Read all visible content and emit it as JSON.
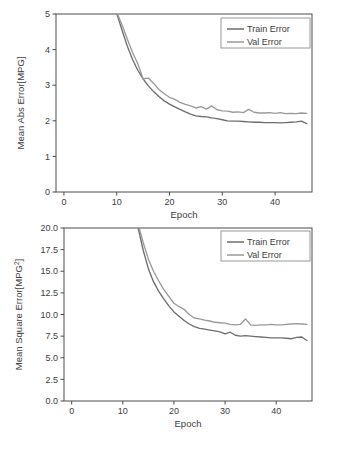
{
  "figure": {
    "background_color": "#ffffff",
    "frame_color": "#4c4c4c",
    "text_color": "#3d3d3d"
  },
  "chart_data": [
    {
      "id": "mean-abs-error",
      "type": "line",
      "title": "",
      "xlabel": "Epoch",
      "ylabel": "Mean Abs Error[MPG]",
      "xlim": [
        -1.5,
        47
      ],
      "ylim": [
        0,
        5
      ],
      "xticks": [
        0,
        10,
        20,
        30,
        40
      ],
      "yticks": [
        0,
        1,
        2,
        3,
        4,
        5
      ],
      "xticklabels": [
        "0",
        "10",
        "20",
        "30",
        "40"
      ],
      "yticklabels": [
        "0",
        "1",
        "2",
        "3",
        "4",
        "5"
      ],
      "grid": false,
      "legend_position": "upper right",
      "series": [
        {
          "name": "Train Error",
          "color": "#6e6e6e",
          "x": [
            0,
            1,
            2,
            3,
            4,
            5,
            6,
            7,
            8,
            9,
            10,
            11,
            12,
            13,
            14,
            15,
            16,
            17,
            18,
            19,
            20,
            21,
            22,
            23,
            24,
            25,
            26,
            27,
            28,
            29,
            30,
            31,
            32,
            33,
            34,
            35,
            36,
            37,
            38,
            39,
            40,
            41,
            42,
            43,
            44,
            45,
            46
          ],
          "values": [
            18.2,
            15.1,
            12.4,
            10.2,
            8.6,
            7.4,
            6.6,
            6.0,
            5.6,
            5.3,
            5.02,
            4.55,
            4.1,
            3.72,
            3.42,
            3.18,
            2.98,
            2.82,
            2.68,
            2.56,
            2.47,
            2.39,
            2.32,
            2.25,
            2.19,
            2.14,
            2.12,
            2.11,
            2.08,
            2.06,
            2.03,
            2.0,
            1.99,
            1.99,
            1.98,
            1.97,
            1.96,
            1.96,
            1.95,
            1.95,
            1.95,
            1.94,
            1.95,
            1.96,
            1.97,
            1.99,
            1.92
          ]
        },
        {
          "name": "Val Error",
          "color": "#9a9a9a",
          "x": [
            0,
            1,
            2,
            3,
            4,
            5,
            6,
            7,
            8,
            9,
            10,
            11,
            12,
            13,
            14,
            15,
            16,
            17,
            18,
            19,
            20,
            21,
            22,
            23,
            24,
            25,
            26,
            27,
            28,
            29,
            30,
            31,
            32,
            33,
            34,
            35,
            36,
            37,
            38,
            39,
            40,
            41,
            42,
            43,
            44,
            45,
            46
          ],
          "values": [
            18.0,
            14.9,
            12.3,
            10.1,
            8.6,
            7.5,
            6.7,
            6.1,
            5.7,
            5.4,
            5.05,
            4.7,
            4.3,
            3.92,
            3.6,
            3.18,
            3.2,
            3.05,
            2.88,
            2.76,
            2.66,
            2.6,
            2.52,
            2.46,
            2.42,
            2.36,
            2.4,
            2.33,
            2.42,
            2.31,
            2.28,
            2.27,
            2.24,
            2.25,
            2.23,
            2.32,
            2.24,
            2.22,
            2.22,
            2.23,
            2.21,
            2.23,
            2.2,
            2.21,
            2.2,
            2.22,
            2.21
          ]
        }
      ]
    },
    {
      "id": "mean-square-error",
      "type": "line",
      "title": "",
      "xlabel": "Epoch",
      "ylabel": "Mean Square Error[MPG2]",
      "ylabel_base": "Mean Square Error[MPG",
      "ylabel_sup": "2",
      "ylabel_tail": "]",
      "xlim": [
        -1.5,
        47
      ],
      "ylim": [
        0,
        20
      ],
      "xticks": [
        0,
        10,
        20,
        30,
        40
      ],
      "yticks": [
        0,
        2.5,
        5,
        7.5,
        10,
        12.5,
        15,
        17.5,
        20
      ],
      "xticklabels": [
        "0",
        "10",
        "20",
        "30",
        "40"
      ],
      "yticklabels": [
        "0.0",
        "2.5",
        "5.0",
        "7.5",
        "10.0",
        "12.5",
        "15.0",
        "17.5",
        "20.0"
      ],
      "grid": false,
      "legend_position": "upper right",
      "series": [
        {
          "name": "Train Error",
          "color": "#6e6e6e",
          "x": [
            0,
            1,
            2,
            3,
            4,
            5,
            6,
            7,
            8,
            9,
            10,
            11,
            12,
            13,
            14,
            15,
            16,
            17,
            18,
            19,
            20,
            21,
            22,
            23,
            24,
            25,
            26,
            27,
            28,
            29,
            30,
            31,
            32,
            33,
            34,
            35,
            36,
            37,
            38,
            39,
            40,
            41,
            42,
            43,
            44,
            45,
            46
          ],
          "values": [
            420,
            330,
            250,
            190,
            145,
            110,
            86,
            68,
            55,
            45,
            37,
            30,
            24.5,
            20.0,
            17.4,
            15.3,
            13.8,
            12.7,
            11.8,
            11.0,
            10.3,
            9.8,
            9.3,
            8.9,
            8.6,
            8.4,
            8.3,
            8.2,
            8.1,
            8.0,
            7.75,
            7.95,
            7.6,
            7.5,
            7.55,
            7.5,
            7.45,
            7.4,
            7.35,
            7.3,
            7.3,
            7.3,
            7.25,
            7.2,
            7.35,
            7.4,
            7.0
          ]
        },
        {
          "name": "Val Error",
          "color": "#9a9a9a",
          "x": [
            0,
            1,
            2,
            3,
            4,
            5,
            6,
            7,
            8,
            9,
            10,
            11,
            12,
            13,
            14,
            15,
            16,
            17,
            18,
            19,
            20,
            21,
            22,
            23,
            24,
            25,
            26,
            27,
            28,
            29,
            30,
            31,
            32,
            33,
            34,
            35,
            36,
            37,
            38,
            39,
            40,
            41,
            42,
            43,
            44,
            45,
            46
          ],
          "values": [
            415,
            328,
            248,
            189,
            144,
            110,
            87,
            69,
            56,
            46,
            38,
            31,
            25.5,
            20.4,
            18.3,
            16.4,
            15.0,
            13.9,
            12.9,
            12.1,
            11.3,
            10.9,
            10.6,
            10.0,
            9.6,
            9.5,
            9.35,
            9.25,
            9.1,
            9.05,
            9.0,
            8.85,
            8.8,
            8.85,
            9.5,
            8.8,
            8.75,
            8.8,
            8.8,
            8.85,
            8.8,
            8.8,
            8.85,
            8.9,
            8.95,
            8.9,
            8.85
          ]
        }
      ]
    }
  ]
}
